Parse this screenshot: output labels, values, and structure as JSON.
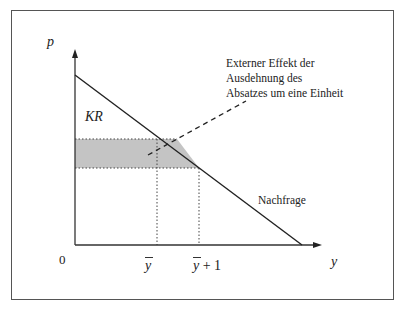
{
  "diagram": {
    "axes": {
      "y_label": "p",
      "x_label": "y",
      "origin_label": "0"
    },
    "curve_label": "Nachfrage",
    "area_label": "KR",
    "annotation": {
      "lines": [
        "Externer Effekt der",
        "Ausdehnung des",
        "Absatzes um eine Einheit"
      ]
    },
    "x_ticks": {
      "tick1": "y",
      "tick2_base": "y",
      "tick2_suffix": "+ 1"
    },
    "colors": {
      "shade": "#c4c4c4",
      "line": "#222222",
      "frame": "#555555"
    }
  }
}
